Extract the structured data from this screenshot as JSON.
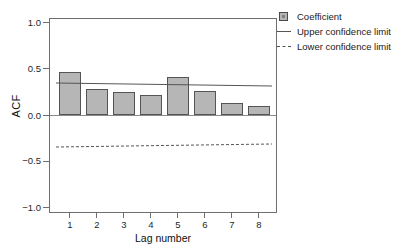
{
  "chart_data": {
    "type": "bar",
    "title": "Mean ZH SDY Domain",
    "xlabel": "Lag number",
    "ylabel": "ACF",
    "categories": [
      "1",
      "2",
      "3",
      "4",
      "5",
      "6",
      "7",
      "8"
    ],
    "values": [
      0.46,
      0.285,
      0.245,
      0.22,
      0.41,
      0.26,
      0.13,
      0.1
    ],
    "series": [
      {
        "name": "Coefficient",
        "type": "bar",
        "values": [
          0.46,
          0.285,
          0.245,
          0.22,
          0.41,
          0.26,
          0.13,
          0.1
        ]
      },
      {
        "name": "Upper confidence limit",
        "type": "line",
        "style": "solid",
        "values": [
          0.345,
          0.34,
          0.335,
          0.33,
          0.325,
          0.32,
          0.315,
          0.31
        ]
      },
      {
        "name": "Lower confidence limit",
        "type": "line",
        "style": "dashed",
        "values": [
          -0.345,
          -0.34,
          -0.335,
          -0.33,
          -0.325,
          -0.32,
          -0.315,
          -0.31
        ]
      }
    ],
    "ylim": [
      -1.0,
      1.0
    ],
    "yticks": [
      "1.0",
      "0.5",
      "0.0",
      "-0.5",
      "-1.0"
    ],
    "ytick_values": [
      1.0,
      0.5,
      0.0,
      -0.5,
      -1.0
    ],
    "xticks": [
      "1",
      "2",
      "3",
      "4",
      "5",
      "6",
      "7",
      "8"
    ],
    "grid": false,
    "legend_position": "top-right",
    "bar_color": "#b6b6b6",
    "bar_border_color": "#545454",
    "line_color": "#555555",
    "axis_color": "#6e6e6e"
  },
  "axes": {
    "y_title": "ACF",
    "x_title": "Lag number",
    "y_tick_labels": [
      {
        "text": "1.0",
        "value": 1.0
      },
      {
        "text": "0.5",
        "value": 0.5
      },
      {
        "text": "0.0",
        "value": 0.0
      },
      {
        "text": "−0.5",
        "value": -0.5
      },
      {
        "text": "−1.0",
        "value": -1.0
      }
    ],
    "x_tick_labels": [
      "1",
      "2",
      "3",
      "4",
      "5",
      "6",
      "7",
      "8"
    ]
  },
  "legend": {
    "items": [
      {
        "label": "Coefficient",
        "marker": "square-swatch"
      },
      {
        "label": "Upper confidence limit",
        "marker": "solid-line"
      },
      {
        "label": "Lower confidence limit",
        "marker": "dashed-line"
      }
    ]
  },
  "title": {
    "text": "Mean ZH SDY Domain"
  }
}
